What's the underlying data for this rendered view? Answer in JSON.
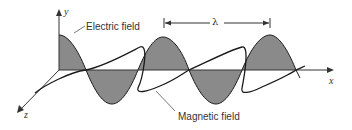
{
  "figure": {
    "labels": {
      "electric_field": "Electric field",
      "magnetic_field": "Magnetic field",
      "wavelength": "λ",
      "axis_x": "x",
      "axis_y": "y",
      "axis_z": "z"
    },
    "colors": {
      "electric_fill": "#8a8a8a",
      "stroke": "#1a1a1a",
      "axis": "#333333",
      "background": "#ffffff"
    },
    "electric_wave": {
      "cycles": 2.25,
      "wavelength_px": 104
    }
  }
}
